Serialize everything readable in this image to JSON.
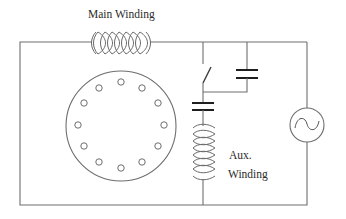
{
  "diagram": {
    "type": "single-phase capacitor-start capacitor-run motor circuit",
    "labels": {
      "main_winding": "Main Winding",
      "aux_line1": "Aux.",
      "aux_line2": "Winding"
    },
    "components": [
      {
        "id": "main-winding",
        "kind": "inductor",
        "label": "Main Winding"
      },
      {
        "id": "rotor",
        "kind": "squirrel-cage rotor",
        "slots": 12
      },
      {
        "id": "centrifugal-switch",
        "kind": "switch",
        "state": "open"
      },
      {
        "id": "start-capacitor",
        "kind": "capacitor",
        "placement": "series with switch (parallel branch)"
      },
      {
        "id": "run-capacitor",
        "kind": "capacitor",
        "placement": "series with aux winding"
      },
      {
        "id": "aux-winding",
        "kind": "inductor",
        "label": "Aux. Winding"
      },
      {
        "id": "ac-source",
        "kind": "AC voltage source",
        "symbol": "sine"
      }
    ],
    "colors": {
      "wire": "#6e6e6e",
      "plate": "#1e1e1e",
      "text": "#2a2a2a",
      "background": "#ffffff"
    }
  }
}
